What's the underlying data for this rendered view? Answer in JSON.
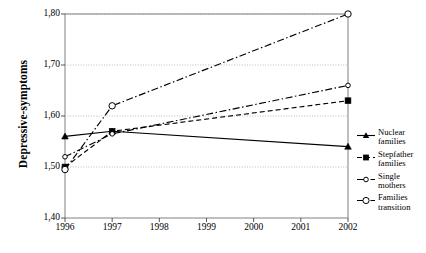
{
  "chart_data": {
    "type": "line",
    "title": "",
    "xlabel": "",
    "ylabel": "Depressive-symptoms",
    "x": [
      1996,
      1997,
      2002
    ],
    "categories": [
      "1996",
      "1997",
      "1998",
      "1999",
      "2000",
      "2001",
      "2002"
    ],
    "xlim": [
      1996,
      2002
    ],
    "ylim": [
      1.4,
      1.8
    ],
    "yticks": [
      "1,40",
      "1,50",
      "1,60",
      "1,70",
      "1,80"
    ],
    "ytick_values": [
      1.4,
      1.5,
      1.6,
      1.7,
      1.8
    ],
    "grid": "horizontal-dotted",
    "legend_position": "right",
    "series": [
      {
        "name": "Nuclear families",
        "label_line1": "Nuclear",
        "label_line2": "families",
        "marker": "filled-triangle",
        "line_style": "solid",
        "color": "#000000",
        "x": [
          1996,
          1997,
          2002
        ],
        "values": [
          1.56,
          1.57,
          1.54
        ]
      },
      {
        "name": "Stepfather families",
        "label_line1": "Stepfather",
        "label_line2": "families",
        "marker": "filled-square",
        "line_style": "dashed",
        "color": "#000000",
        "x": [
          1996,
          1997,
          2002
        ],
        "values": [
          1.5,
          1.57,
          1.63
        ]
      },
      {
        "name": "Single mothers",
        "label_line1": "Single",
        "label_line2": "mothers",
        "marker": "open-circle-small",
        "line_style": "dash-dot",
        "color": "#000000",
        "x": [
          1996,
          1997,
          2002
        ],
        "values": [
          1.52,
          1.565,
          1.66
        ]
      },
      {
        "name": "Families transition",
        "label_line1": "Families",
        "label_line2": "transition",
        "marker": "open-circle-large",
        "line_style": "dash-dot",
        "color": "#000000",
        "x": [
          1996,
          1997,
          2002
        ],
        "values": [
          1.495,
          1.62,
          1.8
        ]
      }
    ]
  },
  "axis": {
    "y_title": "Depressive-symptoms"
  },
  "colors": {
    "plot_border": "#808080",
    "gridline": "#bbbbbb",
    "ink": "#000000",
    "background": "#ffffff"
  }
}
